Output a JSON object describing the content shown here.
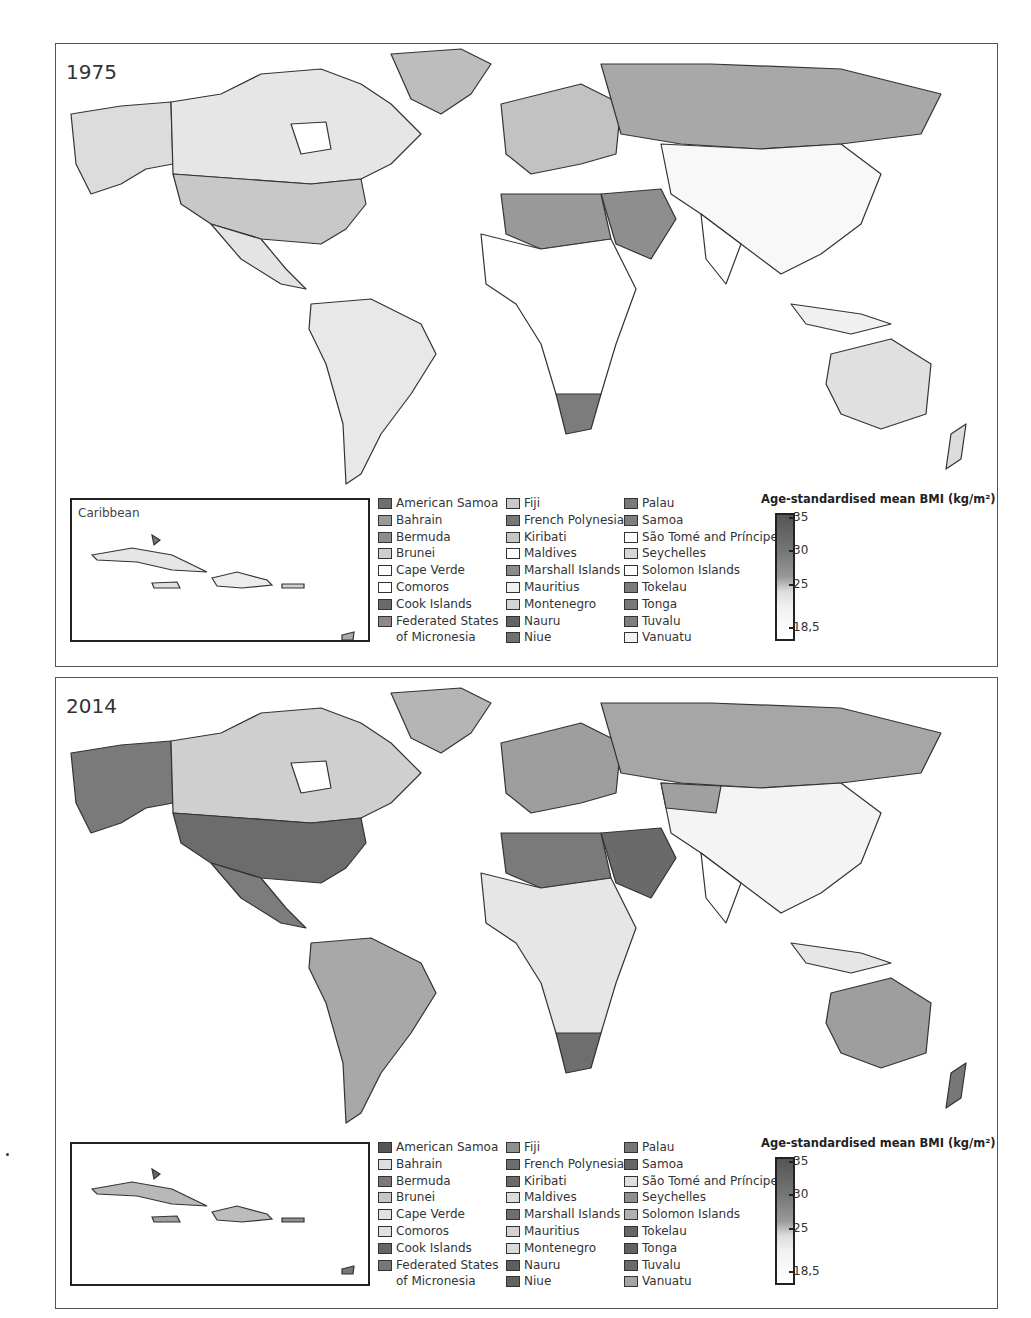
{
  "figure": {
    "panels": [
      {
        "year": "1975",
        "inset_label": "Caribbean",
        "scale": {
          "title": "Age-standardised mean BMI (kg/m²)",
          "ticks": [
            "35",
            "30",
            "25",
            "18,5"
          ]
        },
        "legend": [
          [
            {
              "label": "American Samoa",
              "color": "#6e6e6e"
            },
            {
              "label": "Bahrain",
              "color": "#9a9a9a"
            },
            {
              "label": "Bermuda",
              "color": "#8c8c8c"
            },
            {
              "label": "Brunei",
              "color": "#cfcfcf"
            },
            {
              "label": "Cape Verde",
              "color": "#ffffff"
            },
            {
              "label": "Comoros",
              "color": "#ffffff"
            },
            {
              "label": "Cook Islands",
              "color": "#6a6a6a"
            },
            {
              "label": "Federated States",
              "color": "#8a8a8a"
            },
            {
              "label": "of Micronesia",
              "color": null
            }
          ],
          [
            {
              "label": "Fiji",
              "color": "#c8c8c8"
            },
            {
              "label": "French Polynesia",
              "color": "#777777"
            },
            {
              "label": "Kiribati",
              "color": "#c6c6c6"
            },
            {
              "label": "Maldives",
              "color": "#ffffff"
            },
            {
              "label": "Marshall Islands",
              "color": "#8a8a8a"
            },
            {
              "label": "Mauritius",
              "color": "#f0f0f0"
            },
            {
              "label": "Montenegro",
              "color": "#d4d4d4"
            },
            {
              "label": "Nauru",
              "color": "#646464"
            },
            {
              "label": "Niue",
              "color": "#707070"
            }
          ],
          [
            {
              "label": "Palau",
              "color": "#7a7a7a"
            },
            {
              "label": "Samoa",
              "color": "#7e7e7e"
            },
            {
              "label": "São Tomé and Príncipe",
              "color": "#ffffff"
            },
            {
              "label": "Seychelles",
              "color": "#d6d6d6"
            },
            {
              "label": "Solomon Islands",
              "color": "#ffffff"
            },
            {
              "label": "Tokelau",
              "color": "#7c7c7c"
            },
            {
              "label": "Tonga",
              "color": "#787878"
            },
            {
              "label": "Tuvalu",
              "color": "#7e7e7e"
            },
            {
              "label": "Vanuatu",
              "color": "#f2f2f2"
            }
          ]
        ]
      },
      {
        "year": "2014",
        "inset_label": "",
        "scale": {
          "title": "Age-standardised mean BMI (kg/m²)",
          "ticks": [
            "35",
            "30",
            "25",
            "18,5"
          ]
        },
        "legend": [
          [
            {
              "label": "American Samoa",
              "color": "#555555"
            },
            {
              "label": "Bahrain",
              "color": "#dedede"
            },
            {
              "label": "Bermuda",
              "color": "#7a7a7a"
            },
            {
              "label": "Brunei",
              "color": "#c6c6c6"
            },
            {
              "label": "Cape Verde",
              "color": "#e2e2e2"
            },
            {
              "label": "Comoros",
              "color": "#e0e0e0"
            },
            {
              "label": "Cook Islands",
              "color": "#666666"
            },
            {
              "label": "Federated States",
              "color": "#777777"
            },
            {
              "label": "of Micronesia",
              "color": null
            }
          ],
          [
            {
              "label": "Fiji",
              "color": "#8e8e8e"
            },
            {
              "label": "French Polynesia",
              "color": "#6e6e6e"
            },
            {
              "label": "Kiribati",
              "color": "#6a6a6a"
            },
            {
              "label": "Maldives",
              "color": "#dcdcdc"
            },
            {
              "label": "Marshall Islands",
              "color": "#6e6e6e"
            },
            {
              "label": "Mauritius",
              "color": "#d2d2d2"
            },
            {
              "label": "Montenegro",
              "color": "#dadada"
            },
            {
              "label": "Nauru",
              "color": "#5e5e5e"
            },
            {
              "label": "Niue",
              "color": "#626262"
            }
          ],
          [
            {
              "label": "Palau",
              "color": "#777777"
            },
            {
              "label": "Samoa",
              "color": "#666666"
            },
            {
              "label": "São Tomé and Príncipe",
              "color": "#dedede"
            },
            {
              "label": "Seychelles",
              "color": "#8e8e8e"
            },
            {
              "label": "Solomon Islands",
              "color": "#b0b0b0"
            },
            {
              "label": "Tokelau",
              "color": "#666666"
            },
            {
              "label": "Tonga",
              "color": "#626262"
            },
            {
              "label": "Tuvalu",
              "color": "#6a6a6a"
            },
            {
              "label": "Vanuatu",
              "color": "#a4a4a4"
            }
          ]
        ]
      }
    ]
  },
  "map_fills": {
    "1975": {
      "north_america": "#e6e6e6",
      "usa": "#c8c8c8",
      "alaska": "#dcdcdc",
      "greenland": "#bdbdbd",
      "south_america": "#e8e8e8",
      "europe": "#c2c2c2",
      "russia": "#a8a8a8",
      "middle_east": "#8e8e8e",
      "north_africa": "#999999",
      "africa": "#ffffff",
      "south_africa": "#7c7c7c",
      "asia": "#f8f8f8",
      "australia": "#e0e0e0"
    },
    "2014": {
      "north_america": "#cfcfcf",
      "usa": "#6c6c6c",
      "alaska": "#7a7a7a",
      "greenland": "#b5b5b5",
      "south_america": "#a8a8a8",
      "europe": "#9e9e9e",
      "russia": "#a6a6a6",
      "middle_east": "#6a6a6a",
      "north_africa": "#7a7a7a",
      "africa": "#e6e6e6",
      "south_africa": "#6e6e6e",
      "asia": "#f4f4f4",
      "australia": "#9e9e9e"
    }
  }
}
